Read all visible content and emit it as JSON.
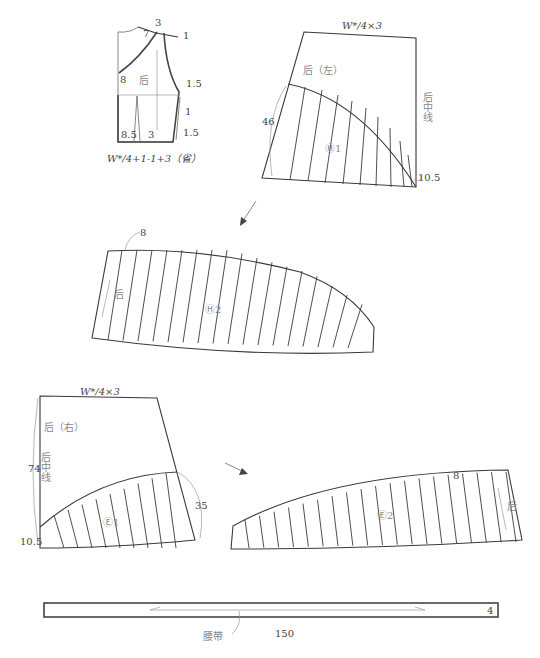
{
  "bodice_sketch": {
    "dimension_labels": [
      "3",
      "7",
      "1",
      "8",
      "1.5",
      "1",
      "8.5",
      "3",
      "1.5"
    ],
    "panel_label": "后",
    "formula": "W*/4+1-1+3（省）"
  },
  "piece_back_left": {
    "top_label": "W*/4×3",
    "panel_label": "后（左）",
    "center_line_label": "后中线",
    "side_length": "46",
    "corner_label": "10.5",
    "section_label": "Ⓗ1"
  },
  "piece_h2": {
    "top_label": "8",
    "grain_label": "后",
    "section_label": "Ⓗ2"
  },
  "piece_back_right": {
    "top_label": "W*/4×3",
    "panel_label": "后（右）",
    "center_line_label": "后中线",
    "side_length": "74",
    "corner_label": "10.5",
    "side_label": "35",
    "section_label": "Ⓔ1"
  },
  "piece_e2": {
    "top_label": "8",
    "grain_label": "后",
    "section_label": "Ⓔ2"
  },
  "waistband": {
    "name_label": "腰带",
    "length_label": "150",
    "width_label": "4"
  }
}
